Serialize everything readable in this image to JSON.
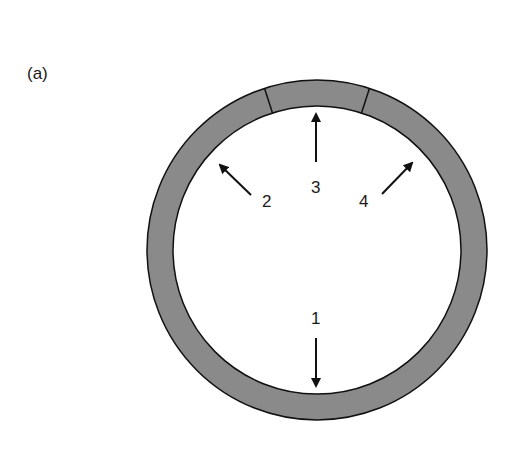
{
  "figure": {
    "panel_label": "(a)",
    "ring": {
      "cx": 317,
      "cy": 250,
      "outer_r": 170,
      "inner_r": 144,
      "fill": "#8a8a8a",
      "stroke": "#111111"
    },
    "segment_dividers_deg": [
      -108,
      -72
    ],
    "arrows": [
      {
        "label": "1",
        "direction": "down"
      },
      {
        "label": "2",
        "direction": "up-left"
      },
      {
        "label": "3",
        "direction": "up"
      },
      {
        "label": "4",
        "direction": "up-right"
      }
    ]
  }
}
